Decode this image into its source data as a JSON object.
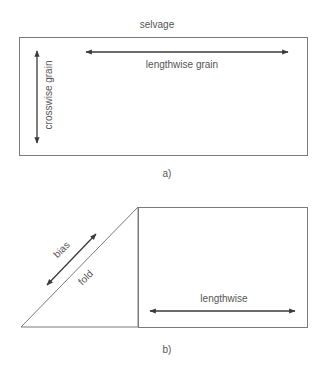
{
  "figure_a": {
    "caption": "a)",
    "top_label": "selvage",
    "horizontal_arrow_label": "lengthwise grain",
    "vertical_arrow_label": "crosswise grain"
  },
  "figure_b": {
    "caption": "b)",
    "diagonal_arrow_label": "bias",
    "diagonal_edge_label": "fold",
    "horizontal_arrow_label": "lengthwise"
  },
  "colors": {
    "outline": "#7a7a7a",
    "arrow": "#3a3a3a",
    "text": "#555555",
    "background": "#ffffff"
  }
}
